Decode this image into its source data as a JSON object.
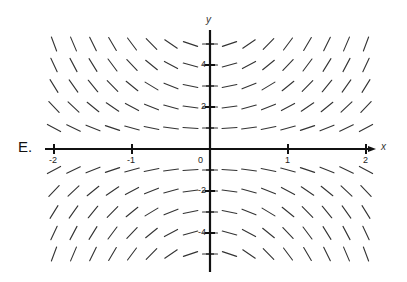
{
  "panel_label": "E.",
  "axes": {
    "x_name": "x",
    "y_name": "y",
    "x_ticks": [
      {
        "value": -2,
        "label": "-2"
      },
      {
        "value": -1,
        "label": "-1"
      },
      {
        "value": 0,
        "label": "0"
      },
      {
        "value": 1,
        "label": "1"
      },
      {
        "value": 2,
        "label": "2"
      }
    ],
    "y_ticks": [
      {
        "value": 4,
        "label": "4"
      },
      {
        "value": 2,
        "label": "2"
      },
      {
        "value": -2,
        "label": "-2"
      },
      {
        "value": -4,
        "label": "-4"
      }
    ]
  },
  "slope_field": {
    "equation_estimate": "dy/dx = x*y",
    "x_samples": [
      -2,
      -1.75,
      -1.5,
      -1.25,
      -1,
      -0.75,
      -0.5,
      -0.25,
      0,
      0.25,
      0.5,
      0.75,
      1,
      1.25,
      1.5,
      1.75,
      2
    ],
    "y_samples": [
      5,
      4,
      3,
      2,
      1,
      -1,
      -2,
      -3,
      -4,
      -5
    ],
    "line_color": "#333333"
  },
  "colors": {
    "axis": "#111111",
    "background": "#ffffff"
  }
}
